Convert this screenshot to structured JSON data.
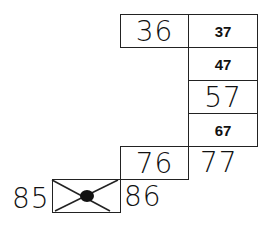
{
  "grid": {
    "cells": [
      {
        "id": "36",
        "text": "36",
        "style": "handwritten"
      },
      {
        "id": "37",
        "text": "37",
        "style": "printed"
      },
      {
        "id": "47",
        "text": "47",
        "style": "printed"
      },
      {
        "id": "57",
        "text": "57",
        "style": "handwritten"
      },
      {
        "id": "67",
        "text": "67",
        "style": "printed"
      },
      {
        "id": "76",
        "text": "76",
        "style": "handwritten"
      },
      {
        "id": "77",
        "text": "77",
        "style": "handwritten"
      },
      {
        "id": "86",
        "text": "86",
        "style": "handwritten"
      },
      {
        "id": "85",
        "text": "85",
        "style": "handwritten"
      },
      {
        "id": "crossed",
        "text": "87",
        "style": "crossed-out"
      }
    ]
  }
}
